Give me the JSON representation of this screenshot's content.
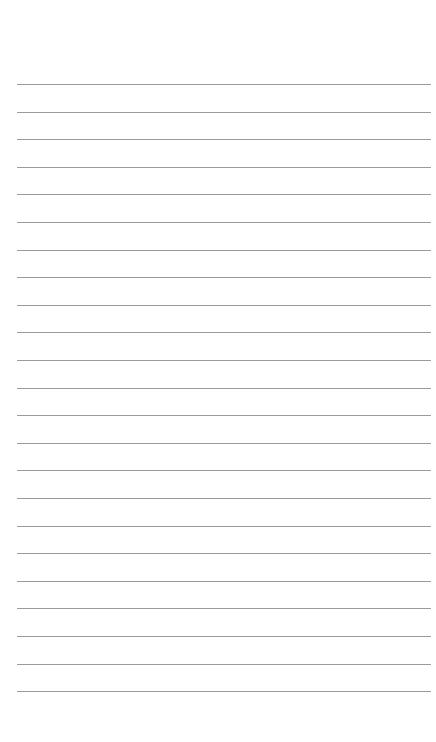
{
  "page": {
    "type": "lined-paper",
    "background_color": "#ffffff",
    "line_color": "#9a9a9a",
    "line_count": 23,
    "first_line_y": 84,
    "line_spacing": 27.6,
    "line_left": 17,
    "line_right": 431
  }
}
